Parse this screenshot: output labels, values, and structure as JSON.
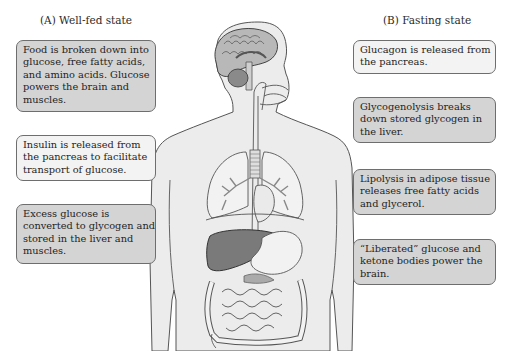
{
  "left_panel": {
    "heading": "(A)  Well-fed state",
    "boxes": [
      {
        "lines": [
          "Food is broken down into",
          "glucose, free fatty acids,",
          "and amino acids. Glucose",
          "powers the brain and",
          "muscles."
        ],
        "shade": "gray"
      },
      {
        "lines": [
          "Insulin is released from",
          "the pancreas to facilitate",
          "transport of glucose."
        ],
        "shade": "light"
      },
      {
        "lines": [
          "Excess glucose is",
          "converted to glycogen and",
          "stored in the liver and",
          "muscles."
        ],
        "shade": "gray"
      }
    ]
  },
  "right_panel": {
    "heading": "(B)  Fasting state",
    "boxes": [
      {
        "lines": [
          "Glucagon is released from",
          "the pancreas."
        ],
        "shade": "light"
      },
      {
        "lines": [
          "Glycogenolysis breaks",
          "down stored glycogen in",
          "the liver."
        ],
        "shade": "gray"
      },
      {
        "lines": [
          "Lipolysis in adipose tissue",
          "releases free fatty acids",
          "and glycerol."
        ],
        "shade": "gray"
      },
      {
        "lines": [
          "“Liberated” glucose and",
          "ketone bodies power the",
          "brain."
        ],
        "shade": "gray"
      }
    ]
  },
  "figure": {
    "organs": [
      "brain",
      "trachea",
      "lungs",
      "heart",
      "liver",
      "stomach",
      "pancreas",
      "intestines"
    ],
    "colors": {
      "body_fill": "#ececec",
      "outline": "#555555",
      "liver": "#7a7a7a",
      "brain": "#b0b0b0",
      "cerebellum": "#8a8a8a",
      "organ_fill": "#f2f2f2",
      "box_gray": "#d4d4d4",
      "box_light": "#f3f3f3"
    }
  }
}
